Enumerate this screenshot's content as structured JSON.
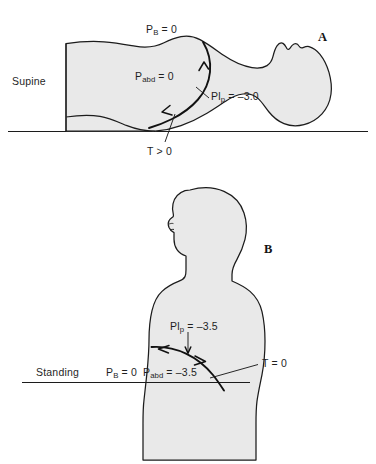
{
  "figure": {
    "background_color": "#ffffff",
    "body_fill_color": "#e9e9e9",
    "outline_color": "#1c1c1c"
  },
  "panels": [
    {
      "id": "A",
      "letter": "A",
      "posture_label": "Supine",
      "labels": {
        "pb": {
          "symbol": "P",
          "subscript": "B",
          "equals": "= 0",
          "full": "PB = 0"
        },
        "pabd": {
          "symbol": "P",
          "subscript": "abd",
          "equals": "= 0",
          "full": "Pabd = 0"
        },
        "plp": {
          "symbol": "Pl",
          "subscript": "p",
          "equals": "= –3.0",
          "full": "Plp = –3.0"
        },
        "tension": {
          "full": "T > 0",
          "symbol": "T",
          "relation": ">",
          "value": "0"
        }
      }
    },
    {
      "id": "B",
      "letter": "B",
      "posture_label": "Standing",
      "labels": {
        "pb": {
          "symbol": "P",
          "subscript": "B",
          "equals": "= 0",
          "full": "PB = 0"
        },
        "pabd": {
          "symbol": "P",
          "subscript": "abd",
          "equals": "= –3.5",
          "full": "Pabd = –3.5"
        },
        "plp": {
          "symbol": "Pl",
          "subscript": "p",
          "equals": "= –3.5",
          "full": "Plp = –3.5"
        },
        "tension": {
          "full": "T = 0",
          "symbol": "T",
          "relation": "=",
          "value": "0"
        }
      }
    }
  ]
}
